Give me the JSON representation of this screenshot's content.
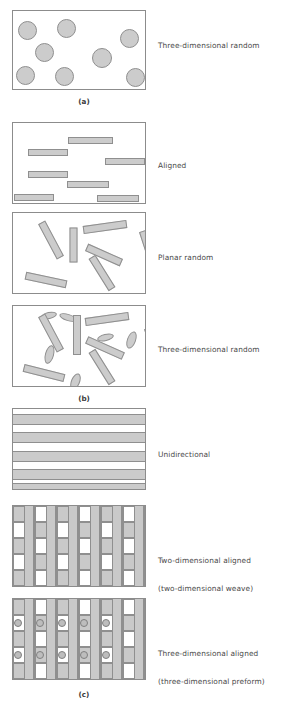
{
  "figure": {
    "colors": {
      "fill_gray": "#cccccc",
      "outline_gray": "#8f8f8f",
      "frame_gray": "#8c8c8c",
      "text_gray": "#4a4a4a",
      "background": "#ffffff"
    }
  },
  "panels": [
    {
      "caption": "(a)",
      "caption_x": 84,
      "caption_y": 97,
      "subpanels": [
        {
          "label": "Three-dimensional random",
          "label_x": 158,
          "label_y": 41,
          "frame": {
            "x": 12,
            "y": 10,
            "w": 134,
            "h": 80
          },
          "type": "particles",
          "shapes": [
            {
              "kind": "circle",
              "cx": 26,
              "cy": 29,
              "r": 9.5
            },
            {
              "kind": "circle",
              "cx": 65,
              "cy": 27,
              "r": 9.5
            },
            {
              "kind": "circle",
              "cx": 128,
              "cy": 37,
              "r": 9.5
            },
            {
              "kind": "circle",
              "cx": 43,
              "cy": 51,
              "r": 9.5
            },
            {
              "kind": "circle",
              "cx": 101,
              "cy": 57,
              "r": 10
            },
            {
              "kind": "circle",
              "cx": 24,
              "cy": 74,
              "r": 9.5
            },
            {
              "kind": "circle",
              "cx": 63,
              "cy": 75,
              "r": 9.5
            },
            {
              "kind": "circle",
              "cx": 134,
              "cy": 76,
              "r": 9.5
            }
          ]
        }
      ]
    },
    {
      "caption": "(b)",
      "caption_x": 84,
      "caption_y": 394,
      "subpanels": [
        {
          "label": "Aligned",
          "label_x": 158,
          "label_y": 161,
          "frame": {
            "x": 12,
            "y": 122,
            "w": 134,
            "h": 82
          },
          "type": "fibers-aligned",
          "shapes": [
            {
              "kind": "rect",
              "x": 67,
              "y": 136,
              "w": 45,
              "h": 7,
              "angle": 0
            },
            {
              "kind": "rect",
              "x": 27,
              "y": 148,
              "w": 40,
              "h": 7,
              "angle": 0
            },
            {
              "kind": "rect",
              "x": 104,
              "y": 157,
              "w": 40,
              "h": 7,
              "angle": 0
            },
            {
              "kind": "rect",
              "x": 27,
              "y": 170,
              "w": 40,
              "h": 7,
              "angle": 0
            },
            {
              "kind": "rect",
              "x": 66,
              "y": 180,
              "w": 42,
              "h": 7,
              "angle": 0
            },
            {
              "kind": "rect",
              "x": 13,
              "y": 193,
              "w": 40,
              "h": 7,
              "angle": 0
            },
            {
              "kind": "rect",
              "x": 96,
              "y": 194,
              "w": 42,
              "h": 7,
              "angle": 0
            }
          ]
        },
        {
          "label": "Planar random",
          "label_x": 158,
          "label_y": 253,
          "frame": {
            "x": 12,
            "y": 212,
            "w": 134,
            "h": 82
          },
          "type": "fibers-planar",
          "shapes": [
            {
              "kind": "rect",
              "x": 82,
              "y": 222,
              "w": 44,
              "h": 8,
              "angle": -8
            },
            {
              "kind": "rect",
              "x": 30,
              "y": 235,
              "w": 40,
              "h": 8,
              "angle": 62
            },
            {
              "kind": "rect",
              "x": 55,
              "y": 240,
              "w": 35,
              "h": 8,
              "angle": 90
            },
            {
              "kind": "rect",
              "x": 84,
              "y": 250,
              "w": 38,
              "h": 8,
              "angle": 24
            },
            {
              "kind": "rect",
              "x": 128,
              "y": 245,
              "w": 40,
              "h": 8,
              "angle": 72
            },
            {
              "kind": "rect",
              "x": 82,
              "y": 268,
              "w": 38,
              "h": 8,
              "angle": 58
            },
            {
              "kind": "rect",
              "x": 24,
              "y": 275,
              "w": 42,
              "h": 8,
              "angle": 12
            }
          ]
        },
        {
          "label": "Three-dimensional random",
          "label_x": 158,
          "label_y": 345,
          "frame": {
            "x": 12,
            "y": 305,
            "w": 134,
            "h": 82
          },
          "type": "fibers-3d",
          "shapes": [
            {
              "kind": "ellipse",
              "x": 40,
              "y": 311,
              "w": 16,
              "h": 7,
              "angle": -12
            },
            {
              "kind": "ellipse",
              "x": 58,
              "y": 313,
              "w": 18,
              "h": 7,
              "angle": 18
            },
            {
              "kind": "rect",
              "x": 84,
              "y": 314,
              "w": 44,
              "h": 8,
              "angle": -8
            },
            {
              "kind": "rect",
              "x": 30,
              "y": 328,
              "w": 40,
              "h": 8,
              "angle": 62
            },
            {
              "kind": "rect",
              "x": 56,
              "y": 330,
              "w": 40,
              "h": 8,
              "angle": 90
            },
            {
              "kind": "ellipse",
              "x": 96,
              "y": 333,
              "w": 17,
              "h": 7,
              "angle": -14
            },
            {
              "kind": "ellipse",
              "x": 126,
              "y": 330,
              "w": 9,
              "h": 18,
              "angle": 20
            },
            {
              "kind": "rect",
              "x": 84,
              "y": 343,
              "w": 40,
              "h": 8,
              "angle": 24
            },
            {
              "kind": "ellipse",
              "x": 44,
              "y": 344,
              "w": 9,
              "h": 19,
              "angle": 15
            },
            {
              "kind": "rect",
              "x": 133,
              "y": 342,
              "w": 40,
              "h": 8,
              "angle": 72
            },
            {
              "kind": "rect",
              "x": 82,
              "y": 362,
              "w": 38,
              "h": 8,
              "angle": 58
            },
            {
              "kind": "rect",
              "x": 22,
              "y": 368,
              "w": 42,
              "h": 8,
              "angle": 14
            },
            {
              "kind": "ellipse",
              "x": 70,
              "y": 372,
              "w": 9,
              "h": 17,
              "angle": 22
            }
          ]
        }
      ]
    },
    {
      "caption": "(c)",
      "caption_x": 84,
      "caption_y": 690,
      "subpanels": [
        {
          "label": "Unidirectional",
          "label_x": 158,
          "label_y": 450,
          "frame": {
            "x": 12,
            "y": 408,
            "w": 134,
            "h": 82
          },
          "type": "unidirectional",
          "bands": [
            {
              "y": 413,
              "h": 11
            },
            {
              "y": 431,
              "h": 11
            },
            {
              "y": 450,
              "h": 11
            },
            {
              "y": 468,
              "h": 11
            },
            {
              "y": 482,
              "h": 7
            }
          ]
        },
        {
          "label_line1": "Two-dimensional aligned",
          "label_line2": "(two-dimensional weave)",
          "label_x": 158,
          "label_y": 537,
          "frame": {
            "x": 12,
            "y": 505,
            "w": 134,
            "h": 82
          },
          "type": "weave-2d",
          "columns": 6,
          "rows": 5
        },
        {
          "label_line1": "Three-dimensional aligned",
          "label_line2": "(three-dimensional preform)",
          "label_x": 158,
          "label_y": 630,
          "frame": {
            "x": 12,
            "y": 598,
            "w": 134,
            "h": 82
          },
          "type": "preform-3d",
          "columns": 6,
          "rows": 5,
          "node_rows": 2,
          "node_cols": 5
        }
      ]
    }
  ]
}
